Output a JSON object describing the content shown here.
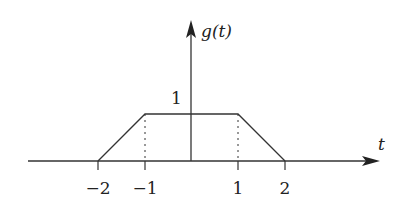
{
  "diagram": {
    "function_label": "g(t)",
    "x_axis_label": "t",
    "y_tick_label": "1",
    "x_ticks": [
      {
        "label": "−2",
        "value": -2
      },
      {
        "label": "−1",
        "value": -1
      },
      {
        "label": "1",
        "value": 1
      },
      {
        "label": "2",
        "value": 2
      }
    ],
    "shape": "trapezoid",
    "points": [
      [
        -2,
        0
      ],
      [
        -1,
        1
      ],
      [
        1,
        1
      ],
      [
        2,
        0
      ]
    ],
    "dashed_guides_at": [
      -1,
      1
    ],
    "line_color": "#333333"
  }
}
